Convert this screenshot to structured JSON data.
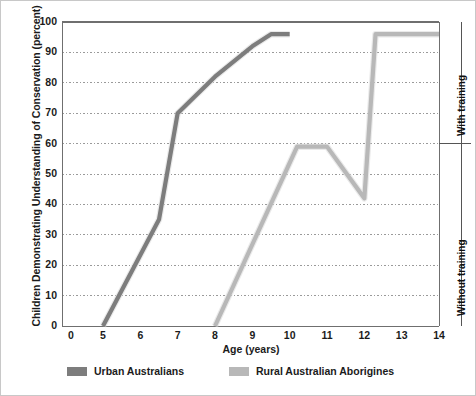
{
  "chart_data": {
    "type": "line",
    "title": "",
    "xlabel": "Age (years)",
    "ylabel": "Children Demonstrating Understanding of Conservation (percent)",
    "xlim": [
      4.6,
      14
    ],
    "ylim": [
      0,
      100
    ],
    "xticks": [
      0,
      5,
      6,
      7,
      8,
      9,
      10,
      11,
      12,
      13,
      14
    ],
    "yticks": [
      0,
      10,
      20,
      30,
      40,
      50,
      60,
      70,
      80,
      90,
      100
    ],
    "grid": true,
    "legend_position": "bottom",
    "series": [
      {
        "name": "Urban Australians",
        "color": "#7d7d7d",
        "points": [
          {
            "x": 5.0,
            "y": 0
          },
          {
            "x": 6.5,
            "y": 35
          },
          {
            "x": 7.0,
            "y": 70
          },
          {
            "x": 8.0,
            "y": 82
          },
          {
            "x": 9.0,
            "y": 92
          },
          {
            "x": 9.5,
            "y": 96
          },
          {
            "x": 10.0,
            "y": 96
          }
        ]
      },
      {
        "name": "Rural Australian Aborigines",
        "color": "#b8b8b8",
        "points": [
          {
            "x": 8.0,
            "y": 0
          },
          {
            "x": 10.2,
            "y": 59
          },
          {
            "x": 11.0,
            "y": 59
          },
          {
            "x": 12.0,
            "y": 42
          },
          {
            "x": 12.3,
            "y": 96
          },
          {
            "x": 13.0,
            "y": 96
          },
          {
            "x": 14.0,
            "y": 96
          }
        ]
      }
    ],
    "annotations": [
      {
        "id": "with-training",
        "text": "With training",
        "position": "right",
        "band": [
          60,
          100
        ]
      },
      {
        "id": "without-training",
        "text": "Without training",
        "position": "right",
        "band": [
          0,
          60
        ]
      }
    ]
  },
  "legend": {
    "entries": [
      {
        "label": "Urban Australians",
        "color": "#7d7d7d"
      },
      {
        "label": "Rural Australian Aborigines",
        "color": "#b8b8b8"
      }
    ]
  },
  "axes": {
    "y_title": "Children Demonstrating Understanding of Conservation (percent)",
    "x_title": "Age (years)"
  },
  "colors": {
    "urban": "#7d7d7d",
    "rural": "#b8b8b8",
    "axis": "#6f6f6f",
    "grid": "#9a9a9a",
    "text": "#1b1b1b",
    "background": "#ffffff",
    "border": "#c8c8c8"
  }
}
